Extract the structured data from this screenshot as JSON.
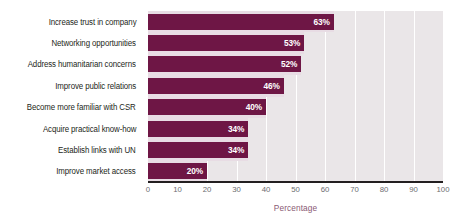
{
  "chart_data": {
    "type": "bar",
    "orientation": "horizontal",
    "title": "",
    "xlabel": "Percentage",
    "ylabel": "",
    "xlim": [
      0,
      100
    ],
    "xticks": [
      0,
      10,
      20,
      30,
      40,
      50,
      60,
      70,
      80,
      90,
      100
    ],
    "grid": true,
    "grid_axis": "x",
    "legend": false,
    "categories": [
      "Increase trust in company",
      "Networking opportunities",
      "Address humanitarian concerns",
      "Improve public relations",
      "Become more familiar with CSR",
      "Acquire practical know-how",
      "Establish links with UN",
      "Improve market access"
    ],
    "values": [
      63,
      53,
      52,
      46,
      40,
      34,
      34,
      20
    ],
    "value_labels": [
      "63%",
      "53%",
      "52%",
      "46%",
      "40%",
      "34%",
      "34%",
      "20%"
    ],
    "colors": {
      "bar": "#6e1645",
      "plot_background": "#eae6e8",
      "row_band": "#e8dce4",
      "gridline": "#ffffff",
      "axis_line": "#231f20",
      "category_label": "#231f20",
      "tick_label": "#6d6e71",
      "axis_title": "#8a5a74",
      "value_label": "#ffffff",
      "page_background": "#ffffff"
    }
  }
}
